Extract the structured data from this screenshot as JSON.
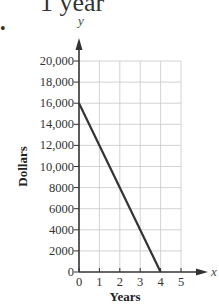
{
  "header": {
    "partial_text": "1 year",
    "bullet": "•"
  },
  "chart_data": {
    "type": "line",
    "title": "",
    "xlabel": "Years",
    "ylabel": "Dollars",
    "x_axis_var": "x",
    "y_axis_var": "y",
    "xlim": [
      0,
      5
    ],
    "ylim": [
      0,
      20000
    ],
    "x_ticks": [
      "0",
      "1",
      "2",
      "3",
      "4",
      "5"
    ],
    "y_ticks": [
      "0",
      "2000",
      "4000",
      "6000",
      "8000",
      "10,000",
      "12,000",
      "14,000",
      "16,000",
      "18,000",
      "20,000"
    ],
    "grid": true,
    "series": [
      {
        "name": "value",
        "x": [
          0,
          4
        ],
        "y": [
          16000,
          0
        ],
        "color": "#333333"
      }
    ]
  }
}
